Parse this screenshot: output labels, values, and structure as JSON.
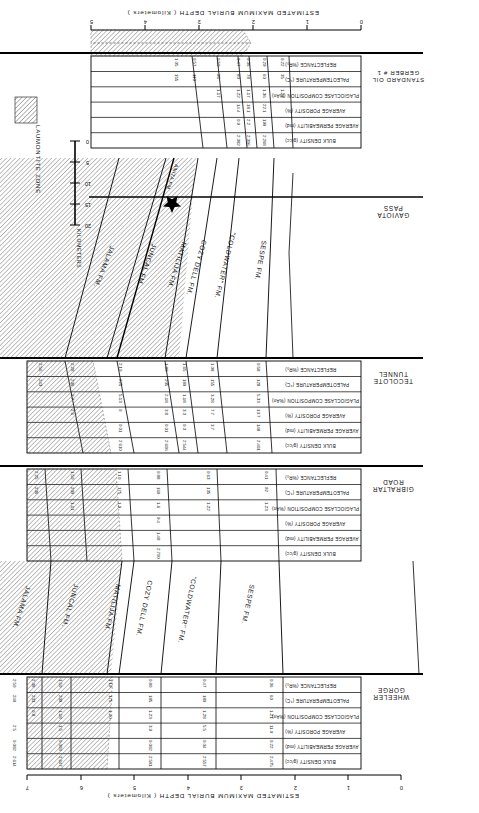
{
  "figure": {
    "axis_top_title": "ESTIMATED MAXIMUM BURIAL DEPTH ( Kilometers )",
    "axis_bottom_title": "ESTIMATED MAXIMUM BURIAL DEPTH ( Kilometers )",
    "axis_top_ticks": [
      "0",
      "1",
      "2",
      "3",
      "4",
      "5",
      "6",
      "7"
    ],
    "axis_bottom_ticks": [
      "0",
      "1",
      "2",
      "3",
      "4",
      "5"
    ],
    "scalebar_title": "KILOMETERS",
    "scalebar_ticks": [
      "0",
      "5",
      "10",
      "15",
      "20"
    ],
    "legend_label": "LAUMONTITE ZONE"
  },
  "localities": [
    {
      "id": "wheeler",
      "name_line1": "WHEELER",
      "name_line2": "GORGE"
    },
    {
      "id": "gibraltar",
      "name_line1": "GIBRALTAR",
      "name_line2": "ROAD"
    },
    {
      "id": "tecolote",
      "name_line1": "TECOLOTE",
      "name_line2": "TUNNEL"
    },
    {
      "id": "gaviota",
      "name_line1": "GAVIOTA",
      "name_line2": "PASS"
    },
    {
      "id": "standard",
      "name_line1": "STANDARD OIL",
      "name_line2": "GERBER # 1"
    }
  ],
  "row_labels": [
    "BULK DENSITY (g/cc)",
    "AVERAGE PERMEABILITY (md)",
    "AVERAGE POROSITY (%)",
    "PLAGIOCLASE COMPOSITION (%An)",
    "PALEOTEMPERATURE (°C)",
    "REFLECTANCE (%R₀)"
  ],
  "formations_upper": [
    "SESPE FM.",
    "\"COLDWATER\" FM.",
    "COZY DELL FM.",
    "MATILIJA FM.",
    "JUNCAL FM.",
    "JALAMA FM."
  ],
  "formations_lower": [
    "SESPE FM.",
    "\"COLDWATER\" FM.",
    "COZY DELL FM.",
    "MATILIJA FM.",
    "JUNCAL FM.",
    "JALAMA FM.",
    "ANITA FM."
  ],
  "chart_data": {
    "type": "table",
    "xlabel": "ESTIMATED MAXIMUM BURIAL DEPTH ( Kilometers )",
    "ylabel": "",
    "xlim_upper": [
      0,
      7
    ],
    "xlim_lower": [
      0,
      5
    ],
    "grid": true,
    "legend": "LAUMONTITE ZONE",
    "row_order": [
      "REFLECTANCE (%R₀)",
      "PALEOTEMPERATURE (°C)",
      "PLAGIOCLASE COMPOSITION (%An)",
      "AVERAGE POROSITY (%)",
      "AVERAGE PERMEABILITY (md)",
      "BULK DENSITY (g/cc)"
    ],
    "sections": [
      {
        "locality": "WHEELER GORGE",
        "columns": [
          "SESPE FM.",
          "\"COLDWATER\" FM.",
          "COZY DELL FM.",
          "MATILIJA FM.",
          "JUNCAL FM.",
          "JALAMA FM."
        ],
        "rows": {
          "REFLECTANCE (%R₀)": [
            "0.36",
            "0.47",
            "0.80",
            "1.19",
            "1.50",
            "2.38",
            "2.50"
          ],
          "PALEOTEMPERATURE (°C)": [
            "60",
            "180",
            "185",
            "175",
            "200",
            "233",
            "240"
          ],
          "PLAGIOCLASE COMPOSITION (%An)": [
            "1-21",
            "1-28",
            "1-23",
            "1-20",
            "1-18",
            "0-8",
            ""
          ],
          "AVERAGE POROSITY (%)": [
            "11.0",
            "5.5",
            "3.9",
            "1.5",
            "2.5",
            "",
            ""
          ],
          "AVERAGE PERMEABILITY (md)": [
            "0.22",
            "0.04",
            "0.002",
            "0.003",
            "0.002",
            ""
          ],
          "BULK DENSITY (g/cc)": [
            "2.475",
            "2.557",
            "2.581",
            "2.647",
            "2.614",
            ""
          ]
        }
      },
      {
        "locality": "GIBRALTAR ROAD",
        "columns": [
          "SESPE FM.",
          "\"COLDWATER\" FM.",
          "COZY DELL FM.",
          "MATILIJA FM.",
          "JUNCAL FM."
        ],
        "rows": {
          "REFLECTANCE (%R₀)": [
            "0.41",
            "0.63",
            "0.88",
            "1.10",
            "1.50",
            "2.25"
          ],
          "PALEOTEMPERATURE (°C)": [
            "92",
            "135",
            "160",
            "175",
            "200",
            "236"
          ],
          "PLAGIOCLASE COMPOSITION (%An)": [
            "1-23",
            "1-22",
            "1-6",
            "1-9",
            "1-11",
            ""
          ],
          "AVERAGE POROSITY (%)": [
            "",
            "",
            "9.4",
            "",
            "",
            ""
          ],
          "AVERAGE PERMEABILITY (md)": [
            "",
            "",
            "1.48",
            "",
            "",
            ""
          ],
          "BULK DENSITY (g/cc)": [
            "",
            "",
            "2.700",
            "",
            "",
            ""
          ]
        }
      },
      {
        "locality": "TECOLOTE TUNNEL",
        "columns": [
          "SESPE FM.",
          "\"COLDWATER\" FM.",
          "COZY DELL FM.",
          "MATILIJA FM.",
          "JUNCAL FM.",
          "JALAMA FM."
        ],
        "rows": {
          "REFLECTANCE (%R₀)": [
            "0.58",
            "1.08",
            "1.65",
            "1.80",
            "2.10",
            "2.28",
            "2.56"
          ],
          "PALEOTEMPERATURE (°C)": [
            "128",
            "155",
            "180",
            "205",
            "225",
            "236",
            "243"
          ],
          "PLAGIOCLASE COMPOSITION (%An)": [
            "5-33",
            "3-28",
            "1-18",
            "2-18",
            "5-13",
            "2-7",
            ""
          ],
          "AVERAGE POROSITY (%)": [
            "13.7",
            "7.7",
            "3.3",
            "3.8",
            "0",
            "2.6",
            ""
          ],
          "AVERAGE PERMEABILITY (md)": [
            "148",
            "3.7",
            "0.3",
            "0.01",
            "0.01",
            "",
            ""
          ],
          "BULK DENSITY (g/cc)": [
            "2.401",
            "",
            "2.544",
            "2.606",
            "2.610",
            ""
          ]
        }
      },
      {
        "locality": "STANDARD OIL GERBER # 1",
        "columns": [
          "SESPE FM.",
          "\"COLDWATER\" FM.",
          "COZY DELL FM.",
          "MATILIJA FM.",
          "JUNCAL FM."
        ],
        "rows": {
          "REFLECTANCE (%R₀)": [
            "0.22",
            "0.29",
            "0.36",
            "0.47",
            "0.50",
            "0.57",
            "1.05"
          ],
          "PALEOTEMPERATURE (°C)": [
            "35",
            "60",
            "78",
            "80",
            "95",
            "110",
            "155"
          ],
          "PLAGIOCLASE COMPOSITION (%An)": [
            "1-27",
            "1-36",
            "1-17",
            "1-22",
            "1-17",
            "",
            ""
          ],
          "AVERAGE POROSITY (%)": [
            "",
            "22.1",
            "18.1",
            "14.4",
            "",
            "",
            ""
          ],
          "AVERAGE PERMEABILITY (md)": [
            "",
            "190",
            "2.2",
            "0.9",
            "",
            "",
            ""
          ],
          "BULK DENSITY (g/cc)": [
            "",
            "2.268",
            "2.306",
            "2.382",
            "",
            "",
            ""
          ]
        }
      }
    ]
  },
  "cells": {
    "wheeler": {
      "c1": {
        "refl": "0.36",
        "temp": "60",
        "plag": "1-21",
        "poro": "11.0",
        "perm": "0.22",
        "dens": "2.475"
      },
      "c2": {
        "refl": "0.47",
        "temp": "180",
        "plag": "1-28",
        "poro": "5.5",
        "perm": "0.04",
        "dens": "2.557"
      },
      "c3": {
        "refl": "0.80",
        "temp": "185",
        "plag": "1-23",
        "poro": "3.9",
        "perm": "0.002",
        "dens": "2.581"
      },
      "c4": {
        "refl": "1.19",
        "temp": "175",
        "plag": "1-20",
        "poro": "",
        "perm": "",
        "dens": ""
      },
      "c5": {
        "refl": "1.50",
        "temp": "200",
        "plag": "1-18",
        "poro": "1.5",
        "perm": "0.003",
        "dens": "2.647"
      },
      "c6": {
        "refl": "2.38",
        "temp": "233",
        "plag": "0-8",
        "poro": "",
        "perm": "",
        "dens": ""
      },
      "c7": {
        "refl": "2.50",
        "temp": "240",
        "plag": "",
        "poro": "2.5",
        "perm": "0.002",
        "dens": "2.614"
      }
    },
    "gibraltar": {
      "c1": {
        "refl": "0.41",
        "temp": "92",
        "plag": "1-23",
        "poro": "",
        "perm": "",
        "dens": ""
      },
      "c2": {
        "refl": "0.63",
        "temp": "135",
        "plag": "1-22",
        "poro": "",
        "perm": "",
        "dens": ""
      },
      "c3": {
        "refl": "0.88",
        "temp": "160",
        "plag": "1-6",
        "poro": "9.4",
        "perm": "1.48",
        "dens": "2.700"
      },
      "c4": {
        "refl": "1.10",
        "temp": "175",
        "plag": "1-9",
        "poro": "",
        "perm": "",
        "dens": ""
      },
      "c5": {
        "refl": "1.50",
        "temp": "200",
        "plag": "1-11",
        "poro": "",
        "perm": "",
        "dens": ""
      },
      "c6": {
        "refl": "2.25",
        "temp": "236",
        "plag": "",
        "poro": "",
        "perm": "",
        "dens": ""
      }
    },
    "tecolote": {
      "c1": {
        "refl": "0.58",
        "temp": "128",
        "plag": "5-33",
        "poro": "13.7",
        "perm": "148",
        "dens": "2.401"
      },
      "c2": {
        "refl": "1.08",
        "temp": "155",
        "plag": "3-28",
        "poro": "7.7",
        "perm": "3.7",
        "dens": ""
      },
      "c3": {
        "refl": "1.65",
        "temp": "180",
        "plag": "1-18",
        "poro": "3.3",
        "perm": "0.3",
        "dens": "2.544"
      },
      "c4": {
        "refl": "1.80",
        "temp": "205",
        "plag": "2-18",
        "poro": "3.8",
        "perm": "0.01",
        "dens": "2.606"
      },
      "c5": {
        "refl": "2.10",
        "temp": "225",
        "plag": "5-13",
        "poro": "0",
        "perm": "0.01",
        "dens": "2.610"
      },
      "c6": {
        "refl": "2.28",
        "temp": "236",
        "plag": "2-7",
        "poro": "2.6",
        "perm": "",
        "dens": ""
      },
      "c7": {
        "refl": "2.56",
        "temp": "243",
        "plag": "",
        "poro": "",
        "perm": "",
        "dens": ""
      }
    },
    "standard": {
      "c1": {
        "refl": "0.22",
        "temp": "35",
        "plag": "1-27",
        "poro": "",
        "perm": "",
        "dens": ""
      },
      "c2": {
        "refl": "0.29",
        "temp": "60",
        "plag": "1-36",
        "poro": "22.1",
        "perm": "190",
        "dens": "2.268"
      },
      "c3": {
        "refl": "0.36",
        "temp": "78",
        "plag": "1-17",
        "poro": "18.1",
        "perm": "2.2",
        "dens": "2.306"
      },
      "c4": {
        "refl": "0.47",
        "temp": "80",
        "plag": "1-22",
        "poro": "14.4",
        "perm": "0.9",
        "dens": "2.382"
      },
      "c5": {
        "refl": "0.50",
        "temp": "95",
        "plag": "1-17",
        "poro": "",
        "perm": "",
        "dens": ""
      },
      "c6": {
        "refl": "0.57",
        "temp": "110",
        "plag": "",
        "poro": "",
        "perm": "",
        "dens": ""
      },
      "c7": {
        "refl": "1.05",
        "temp": "155",
        "plag": "",
        "poro": "",
        "perm": "",
        "dens": ""
      }
    }
  }
}
